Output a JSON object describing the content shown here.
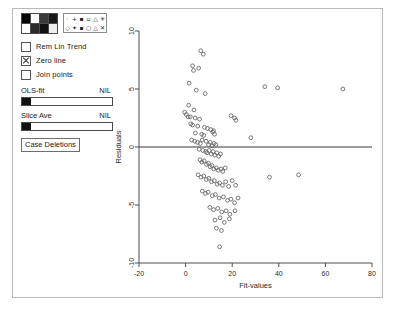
{
  "window": {
    "name": "residual-plot-window"
  },
  "controls": {
    "color_palette": {
      "name": "color-palette",
      "swatches": [
        "#000000",
        "#ffffff",
        "#3a3a3a",
        "#1a1a1a",
        "#ffffff",
        "#2b2b2b",
        "#111111",
        "#efefef"
      ]
    },
    "symbol_palette": {
      "name": "symbol-palette",
      "row1": [
        "·",
        "+",
        "▪",
        "▫",
        "△",
        "✳"
      ],
      "row2": [
        "◇",
        "✦",
        "▪",
        "○",
        "△",
        "✕"
      ]
    },
    "checkboxes": [
      {
        "label": "Rem Lin Trend",
        "checked": false
      },
      {
        "label": "Zero line",
        "checked": true
      },
      {
        "label": "Join points",
        "checked": false
      }
    ],
    "sliders": [
      {
        "label": "OLS-fit",
        "value": "NIL"
      },
      {
        "label": "Slice Ave",
        "value": "NIL"
      }
    ],
    "button": {
      "label": "Case Deletions"
    }
  },
  "chart_data": {
    "type": "scatter",
    "title": "",
    "xlabel": "Fit-values",
    "ylabel": "Residuals",
    "xlim": [
      -20,
      80
    ],
    "ylim": [
      -10,
      10
    ],
    "xticks": [
      -20,
      0,
      20,
      40,
      60,
      80
    ],
    "yticks": [
      -10,
      -5,
      0,
      5,
      10
    ],
    "grid": false,
    "legend": null,
    "annotations": [
      {
        "type": "hline",
        "y": 0,
        "label": "Zero line"
      }
    ],
    "marker": "open-circle",
    "points": [
      [
        6.5,
        8.3
      ],
      [
        7.6,
        8.0
      ],
      [
        3.0,
        7.0
      ],
      [
        3.4,
        6.6
      ],
      [
        5.6,
        6.8
      ],
      [
        1.5,
        5.5
      ],
      [
        4.6,
        4.9
      ],
      [
        8.4,
        4.6
      ],
      [
        34.0,
        5.2
      ],
      [
        39.5,
        5.1
      ],
      [
        67.5,
        5.0
      ],
      [
        1.3,
        3.6
      ],
      [
        3.6,
        3.2
      ],
      [
        -0.4,
        3.0
      ],
      [
        0.3,
        2.8
      ],
      [
        1.1,
        2.6
      ],
      [
        2.0,
        2.6
      ],
      [
        4.1,
        2.5
      ],
      [
        6.0,
        2.4
      ],
      [
        19.5,
        2.7
      ],
      [
        21.0,
        2.5
      ],
      [
        21.6,
        2.3
      ],
      [
        2.2,
        2.0
      ],
      [
        3.0,
        1.9
      ],
      [
        5.2,
        1.8
      ],
      [
        8.1,
        1.7
      ],
      [
        9.4,
        1.6
      ],
      [
        10.8,
        1.5
      ],
      [
        12.0,
        1.4
      ],
      [
        4.2,
        1.2
      ],
      [
        6.9,
        1.1
      ],
      [
        7.8,
        1.0
      ],
      [
        11.6,
        1.3
      ],
      [
        12.4,
        1.1
      ],
      [
        28.0,
        0.8
      ],
      [
        2.6,
        0.6
      ],
      [
        3.9,
        0.5
      ],
      [
        5.1,
        0.4
      ],
      [
        6.3,
        0.3
      ],
      [
        7.1,
        0.6
      ],
      [
        8.8,
        0.5
      ],
      [
        9.9,
        0.2
      ],
      [
        10.6,
        0.4
      ],
      [
        11.4,
        0.1
      ],
      [
        12.2,
        0.3
      ],
      [
        13.0,
        0.2
      ],
      [
        5.8,
        -0.2
      ],
      [
        7.4,
        -0.3
      ],
      [
        8.6,
        -0.4
      ],
      [
        9.2,
        -0.5
      ],
      [
        10.1,
        -0.3
      ],
      [
        11.0,
        -0.6
      ],
      [
        11.8,
        -0.4
      ],
      [
        12.6,
        -0.7
      ],
      [
        13.4,
        -0.5
      ],
      [
        14.2,
        -0.8
      ],
      [
        15.0,
        -0.6
      ],
      [
        6.2,
        -1.1
      ],
      [
        7.0,
        -1.3
      ],
      [
        8.0,
        -1.2
      ],
      [
        9.0,
        -1.5
      ],
      [
        9.8,
        -1.4
      ],
      [
        10.5,
        -1.7
      ],
      [
        11.3,
        -1.6
      ],
      [
        12.1,
        -1.9
      ],
      [
        13.2,
        -1.8
      ],
      [
        14.0,
        -2.0
      ],
      [
        15.2,
        -1.9
      ],
      [
        16.0,
        -2.1
      ],
      [
        17.0,
        -1.8
      ],
      [
        5.4,
        -2.4
      ],
      [
        6.6,
        -2.6
      ],
      [
        7.8,
        -2.5
      ],
      [
        8.9,
        -2.8
      ],
      [
        10.0,
        -2.7
      ],
      [
        11.1,
        -3.0
      ],
      [
        12.3,
        -2.9
      ],
      [
        13.5,
        -3.2
      ],
      [
        14.6,
        -3.1
      ],
      [
        15.8,
        -3.3
      ],
      [
        17.2,
        -3.0
      ],
      [
        18.5,
        -3.4
      ],
      [
        20.0,
        -2.9
      ],
      [
        21.5,
        -3.3
      ],
      [
        36.0,
        -2.6
      ],
      [
        48.5,
        -2.4
      ],
      [
        7.2,
        -3.8
      ],
      [
        8.5,
        -4.0
      ],
      [
        9.7,
        -3.9
      ],
      [
        11.5,
        -4.2
      ],
      [
        12.8,
        -4.1
      ],
      [
        14.4,
        -4.4
      ],
      [
        16.2,
        -4.3
      ],
      [
        18.0,
        -4.6
      ],
      [
        19.4,
        -4.5
      ],
      [
        21.0,
        -4.8
      ],
      [
        22.5,
        -4.4
      ],
      [
        10.4,
        -5.2
      ],
      [
        12.0,
        -5.4
      ],
      [
        13.8,
        -5.3
      ],
      [
        15.5,
        -5.6
      ],
      [
        17.4,
        -5.5
      ],
      [
        19.0,
        -5.8
      ],
      [
        21.2,
        -5.5
      ],
      [
        12.6,
        -6.3
      ],
      [
        14.8,
        -6.1
      ],
      [
        16.6,
        -6.5
      ],
      [
        18.8,
        -6.2
      ],
      [
        13.2,
        -7.0
      ],
      [
        15.4,
        -7.2
      ],
      [
        14.6,
        -8.6
      ]
    ]
  }
}
